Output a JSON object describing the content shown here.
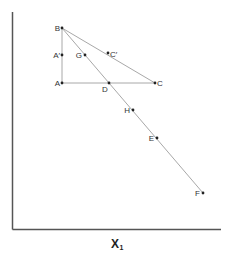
{
  "axes": {
    "origin": [
      12.5,
      229.5
    ],
    "y_top": 12,
    "x_right": 221,
    "x_label": {
      "main": "X",
      "sub": "1",
      "x": 111,
      "y": 248
    }
  },
  "points": [
    {
      "id": "B",
      "label": "B",
      "x": 62,
      "y": 28,
      "lx": 60,
      "ly": 31,
      "anchor": "end"
    },
    {
      "id": "A-prime",
      "label": "A′",
      "x": 62,
      "y": 55,
      "lx": 60,
      "ly": 58,
      "anchor": "end"
    },
    {
      "id": "A",
      "label": "A",
      "x": 62,
      "y": 83,
      "lx": 60,
      "ly": 86,
      "anchor": "end"
    },
    {
      "id": "G",
      "label": "G",
      "x": 85,
      "y": 55,
      "lx": 82,
      "ly": 58,
      "anchor": "end"
    },
    {
      "id": "C-prime",
      "label": "C′",
      "x": 108,
      "y": 53,
      "lx": 110,
      "ly": 57,
      "anchor": "start"
    },
    {
      "id": "D",
      "label": "D",
      "x": 109,
      "y": 83,
      "lx": 102,
      "ly": 92,
      "anchor": "start"
    },
    {
      "id": "C",
      "label": "C",
      "x": 155,
      "y": 83,
      "lx": 157,
      "ly": 86,
      "anchor": "start"
    },
    {
      "id": "H",
      "label": "H",
      "x": 133,
      "y": 110,
      "lx": 130,
      "ly": 113,
      "anchor": "end"
    },
    {
      "id": "E",
      "label": "E",
      "x": 157,
      "y": 138,
      "lx": 154,
      "ly": 141,
      "anchor": "end"
    },
    {
      "id": "F",
      "label": "F",
      "x": 203,
      "y": 193,
      "lx": 200,
      "ly": 196,
      "anchor": "end"
    }
  ],
  "lines": [
    {
      "id": "B-A",
      "from": [
        62,
        28
      ],
      "to": [
        62,
        83
      ]
    },
    {
      "id": "A-C",
      "from": [
        62,
        83
      ],
      "to": [
        155,
        83
      ]
    },
    {
      "id": "B-C",
      "from": [
        62,
        28
      ],
      "to": [
        155,
        83
      ]
    },
    {
      "id": "B-F",
      "from": [
        62,
        28
      ],
      "to": [
        203,
        193
      ]
    }
  ],
  "colors": {
    "axis": "#555555",
    "line": "#a8a8a8",
    "point": "#222222",
    "label": "#333333"
  }
}
